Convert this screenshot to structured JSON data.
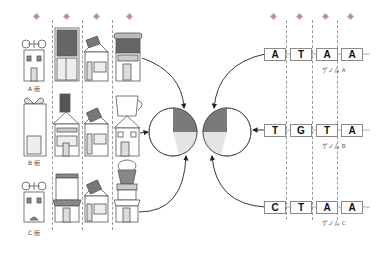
{
  "diagram": {
    "title": "",
    "streets": [
      {
        "label": "A 街",
        "shops": [
          "house",
          "THE BOOK SHELF",
          "bookstore",
          "awning shop"
        ]
      },
      {
        "label": "B 街",
        "shops": [
          "House of GLASS",
          "book-top shop",
          "bookstore",
          "JOE'S Cafe"
        ]
      },
      {
        "label": "C 街",
        "shops": [
          "house",
          "BOOK BIN",
          "bookstore",
          "cupcake shop"
        ]
      }
    ],
    "shop_signs": {
      "book_shelf": "THE BOOK SHELF",
      "house_of_glass_1": "House",
      "house_of_glass_2": "of",
      "house_of_glass_3": "GLASS",
      "joes": "JOE'S",
      "cafe": "Cafe",
      "book_bin_1": "BOOK",
      "book_bin_2": "BIN"
    },
    "genomes": [
      {
        "label": "ゲノム A",
        "bases": [
          "A",
          "T",
          "A",
          "A"
        ]
      },
      {
        "label": "ゲノム B",
        "bases": [
          "T",
          "G",
          "T",
          "A"
        ]
      },
      {
        "label": "ゲノム C",
        "bases": [
          "C",
          "T",
          "A",
          "A"
        ]
      }
    ],
    "pie_left": {
      "slices": [
        {
          "name": "dark",
          "color": "#7a7a7a",
          "start_deg": 0,
          "end_deg": 90
        },
        {
          "name": "light",
          "color": "#e4e4e4",
          "start_deg": 90,
          "end_deg": 165
        },
        {
          "name": "white",
          "color": "#ffffff",
          "start_deg": 165,
          "end_deg": 360
        }
      ]
    },
    "pie_right": {
      "slices": [
        {
          "name": "dark",
          "color": "#7a7a7a",
          "start_deg": 270,
          "end_deg": 360
        },
        {
          "name": "light",
          "color": "#e4e4e4",
          "start_deg": 195,
          "end_deg": 270
        },
        {
          "name": "white",
          "color": "#ffffff",
          "start_deg": 0,
          "end_deg": 195
        }
      ]
    },
    "colors": {
      "marker": "#c9a3a8",
      "dark_slice": "#7a7a7a",
      "light_slice": "#e4e4e4",
      "outline": "#555555",
      "dash": "#9a9a9a"
    }
  }
}
